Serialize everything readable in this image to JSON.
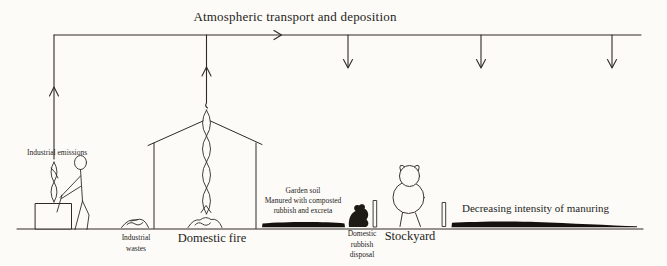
{
  "figure": {
    "title": "Atmospheric transport and deposition",
    "labels": {
      "industrial_emissions": "Industrial emissions",
      "industrial_wastes": [
        "Industrial",
        "wastes"
      ],
      "domestic_fire": "Domestic fire",
      "garden_soil": [
        "Garden soil",
        "Manured with composted",
        "rubbish and excreta"
      ],
      "domestic_rubbish": [
        "Domestic",
        "rubbish",
        "disposal"
      ],
      "stockyard": "Stockyard",
      "decreasing_manuring": "Decreasing intensity of manuring"
    },
    "colors": {
      "ink": "#2e2b27",
      "soil_fill": "#15120e",
      "background": "#fcfbf8"
    }
  }
}
